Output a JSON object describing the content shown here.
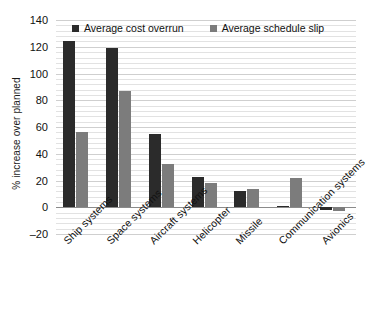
{
  "chart_data": {
    "type": "bar",
    "title": "",
    "xlabel": "",
    "ylabel": "% increase over planned",
    "ylim": [
      -20,
      140
    ],
    "ytick_step": 20,
    "yticks": [
      "140",
      "120",
      "100",
      "80",
      "60",
      "40",
      "20",
      "0",
      "–20"
    ],
    "ytick_values": [
      140,
      120,
      100,
      80,
      60,
      40,
      20,
      0,
      -20
    ],
    "grid": true,
    "minor_grid": true,
    "legend_position": "top-center",
    "categories": [
      "Ship systems",
      "Space systems",
      "Aircraft systems",
      "Helicopter",
      "Missile",
      "Communication systems",
      "Avionics"
    ],
    "series": [
      {
        "name": "Average cost overrun",
        "color": "#2b2b2b",
        "values": [
          124,
          119,
          55,
          22.5,
          12,
          1,
          -2
        ]
      },
      {
        "name": "Average schedule slip",
        "color": "#7c7c7c",
        "values": [
          56,
          87,
          32,
          18,
          13.5,
          22,
          -2.5
        ]
      }
    ]
  },
  "colors": {
    "cost_overrun": "#2b2b2b",
    "schedule_slip": "#7c7c7c",
    "gridline": "#cfcfcf",
    "minor_gridline": "#e2e2e2",
    "zero_line": "#8a8a8a",
    "text": "#111111",
    "background": "#ffffff"
  }
}
